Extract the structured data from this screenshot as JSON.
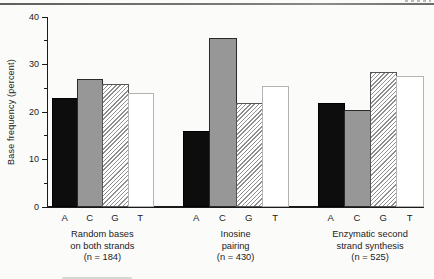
{
  "chart_data": {
    "type": "bar",
    "title": "",
    "ylabel": "Base frequency (percent)",
    "xlabel": "",
    "ylim": [
      0,
      40
    ],
    "yticks_major": [
      0,
      10,
      20,
      30,
      40
    ],
    "yticks_minor": [
      5,
      15,
      25,
      35
    ],
    "bases": [
      "A",
      "C",
      "G",
      "T"
    ],
    "grid": "off",
    "legend": "none",
    "groups": [
      {
        "caption_lines": [
          "Random bases",
          "on both strands",
          "(n = 184)"
        ],
        "n": 184,
        "values": {
          "A": 23,
          "C": 27,
          "G": 26,
          "T": 24
        }
      },
      {
        "caption_lines": [
          "Inosine",
          "pairing",
          "(n = 430)"
        ],
        "n": 430,
        "values": {
          "A": 16,
          "C": 35.5,
          "G": 22,
          "T": 25.5
        }
      },
      {
        "caption_lines": [
          "Enzymatic second",
          "strand synthesis",
          "(n = 525)"
        ],
        "n": 525,
        "values": {
          "A": 22,
          "C": 20.5,
          "G": 28.5,
          "T": 27.5
        }
      }
    ],
    "bar_styles": {
      "A": {
        "pattern": "solid",
        "fill": "#0d0d0d",
        "border": "#000000"
      },
      "C": {
        "pattern": "solid",
        "fill": "#979797",
        "border": "#2a2a2a"
      },
      "G": {
        "pattern": "diagonal-hatch",
        "fill": "#ffffff",
        "hatch_color": "#8f8f8f",
        "border": "#555555"
      },
      "T": {
        "pattern": "solid",
        "fill": "#ffffff",
        "border": "#b3b3b3"
      }
    },
    "axis_color": "#1b1b1b"
  }
}
